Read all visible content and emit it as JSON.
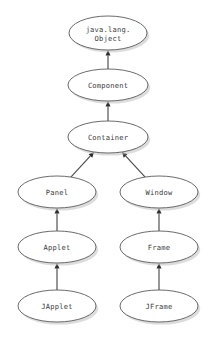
{
  "diagram": {
    "type": "class-hierarchy",
    "background_color": "#ffffff",
    "node_fill": "#ffffff",
    "node_stroke": "#5a5a5a",
    "edge_color": "#4a4a4a",
    "shadow_color": "#bfbfbf",
    "nodes": [
      {
        "id": "object",
        "label_line1": "java.lang.",
        "label_line2": "Object",
        "cx": 108,
        "cy": 33,
        "rx": 39,
        "ry": 17,
        "two_line": true
      },
      {
        "id": "component",
        "label_line1": "Component",
        "label_line2": "",
        "cx": 108,
        "cy": 85,
        "rx": 40,
        "ry": 16,
        "two_line": false
      },
      {
        "id": "container",
        "label_line1": "Container",
        "label_line2": "",
        "cx": 108,
        "cy": 137,
        "rx": 40,
        "ry": 16,
        "two_line": false
      },
      {
        "id": "panel",
        "label_line1": "Panel",
        "label_line2": "",
        "cx": 57,
        "cy": 192,
        "rx": 39,
        "ry": 16,
        "two_line": false
      },
      {
        "id": "window",
        "label_line1": "Window",
        "label_line2": "",
        "cx": 159,
        "cy": 192,
        "rx": 39,
        "ry": 16,
        "two_line": false
      },
      {
        "id": "applet",
        "label_line1": "Applet",
        "label_line2": "",
        "cx": 57,
        "cy": 247,
        "rx": 39,
        "ry": 16,
        "two_line": false
      },
      {
        "id": "frame",
        "label_line1": "Frame",
        "label_line2": "",
        "cx": 159,
        "cy": 247,
        "rx": 39,
        "ry": 16,
        "two_line": false
      },
      {
        "id": "japplet",
        "label_line1": "JApplet",
        "label_line2": "",
        "cx": 57,
        "cy": 306,
        "rx": 39,
        "ry": 16,
        "two_line": false
      },
      {
        "id": "jframe",
        "label_line1": "JFrame",
        "label_line2": "",
        "cx": 159,
        "cy": 306,
        "rx": 39,
        "ry": 16,
        "two_line": false
      }
    ],
    "edges": [
      {
        "id": "component-to-object",
        "from": "component",
        "to": "object",
        "kind": "generalization"
      },
      {
        "id": "container-to-component",
        "from": "container",
        "to": "component",
        "kind": "generalization"
      },
      {
        "id": "panel-to-container",
        "from": "panel",
        "to": "container",
        "kind": "generalization"
      },
      {
        "id": "window-to-container",
        "from": "window",
        "to": "container",
        "kind": "generalization"
      },
      {
        "id": "applet-to-panel",
        "from": "applet",
        "to": "panel",
        "kind": "generalization"
      },
      {
        "id": "frame-to-window",
        "from": "frame",
        "to": "window",
        "kind": "generalization"
      },
      {
        "id": "japplet-to-applet",
        "from": "japplet",
        "to": "applet",
        "kind": "generalization"
      },
      {
        "id": "jframe-to-frame",
        "from": "jframe",
        "to": "frame",
        "kind": "generalization"
      }
    ]
  }
}
